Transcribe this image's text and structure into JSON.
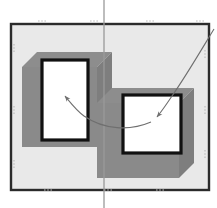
{
  "figure": {
    "width": 217,
    "height": 208,
    "background": "#ffffff"
  },
  "colors": {
    "page_background": "#ffffff",
    "canvas_fill": "#e9e9e9",
    "canvas_stroke": "#2b2b2b",
    "box_fill_top": "#8d8d8d",
    "box_fill_side": "#7e7e7e",
    "box_fill_front": "#8a8a8a",
    "window_fill": "#ffffff",
    "window_stroke": "#111111",
    "axis_line": "#9a9a9a",
    "arrow_stroke": "#6f6f6f",
    "tick_mark": "#bdbdbd"
  },
  "canvas_frame": {
    "name": "outer-frame",
    "x": 11,
    "y": 24,
    "width": 198,
    "height": 166,
    "stroke_width": 2.4
  },
  "vertical_axis": {
    "name": "vertical-axis-line",
    "x": 104,
    "y1": 0,
    "y2": 208,
    "stroke_width": 1.3
  },
  "boxes": [
    {
      "id": "left-box",
      "label": "left-extruded-box",
      "front": [
        [
          22,
          67
        ],
        [
          22,
          147
        ],
        [
          37,
          158
        ],
        [
          97,
          158
        ],
        [
          97,
          77
        ],
        [
          82,
          67
        ]
      ],
      "top": [
        [
          22,
          67
        ],
        [
          37,
          52
        ],
        [
          97,
          52
        ],
        [
          82,
          67
        ]
      ],
      "side": [
        [
          22,
          67
        ],
        [
          22,
          147
        ],
        [
          37,
          158
        ],
        [
          37,
          80
        ],
        [
          37,
          80
        ],
        [
          37,
          52
        ]
      ],
      "outline_top": [
        [
          22,
          67
        ],
        [
          37,
          52
        ],
        [
          97,
          52
        ],
        [
          112,
          67
        ],
        [
          112,
          143
        ],
        [
          97,
          158
        ],
        [
          37,
          158
        ],
        [
          22,
          147
        ]
      ]
    },
    {
      "id": "right-box",
      "label": "right-extruded-box",
      "outline_top": [
        [
          104,
          103
        ],
        [
          119,
          88
        ],
        [
          179,
          88
        ],
        [
          194,
          103
        ],
        [
          194,
          178
        ],
        [
          179,
          193
        ],
        [
          119,
          193
        ],
        [
          104,
          182
        ]
      ]
    }
  ],
  "windows": [
    {
      "id": "left-window",
      "label": "left-window-rect",
      "x": 42,
      "y": 60,
      "width": 46,
      "height": 80,
      "stroke_width": 3.2
    },
    {
      "id": "right-window",
      "label": "right-window-rect",
      "x": 123,
      "y": 95,
      "width": 58,
      "height": 58,
      "stroke_width": 3.2
    }
  ],
  "arrows": [
    {
      "id": "arrow-right-to-left",
      "label": "mapping-arrow-left",
      "path": "M 151,122 C 130,131 104,130 84,116 C 76,110 70,102 65,96",
      "head_at": [
        63,
        94
      ],
      "head_angle_deg": 228,
      "stroke_width": 1.1
    },
    {
      "id": "arrow-outside-to-right",
      "label": "mapping-arrow-right",
      "path": "M 214,29 C 200,52 186,76 172,96 C 166,105 161,112 157,117",
      "head_at": [
        154,
        120
      ],
      "head_angle_deg": 128,
      "stroke_width": 1.1
    }
  ],
  "tick_marks": {
    "label": "dashed-guide-ticks",
    "top": [
      {
        "x": 38,
        "y": 21,
        "len": 9
      },
      {
        "x": 90,
        "y": 21,
        "len": 9
      },
      {
        "x": 146,
        "y": 21,
        "len": 9
      },
      {
        "x": 196,
        "y": 21,
        "len": 9
      }
    ],
    "bottom": [
      {
        "x": 44,
        "y": 190,
        "len": 9
      },
      {
        "x": 104,
        "y": 190,
        "len": 9
      },
      {
        "x": 156,
        "y": 190,
        "len": 9
      }
    ],
    "left": [
      {
        "x": 14,
        "y": 44,
        "len": 9
      },
      {
        "x": 14,
        "y": 106,
        "len": 9
      },
      {
        "x": 14,
        "y": 160,
        "len": 9
      }
    ],
    "right": [
      {
        "x": 205,
        "y": 50,
        "len": 9
      },
      {
        "x": 205,
        "y": 106,
        "len": 9
      },
      {
        "x": 205,
        "y": 150,
        "len": 9
      }
    ]
  },
  "chart_data": {
    "type": "diagram",
    "title": "",
    "elements": [
      "outer-frame",
      "vertical-axis-line",
      "left-extruded-box",
      "right-extruded-box",
      "left-window-rect",
      "right-window-rect",
      "mapping-arrow-left",
      "mapping-arrow-right",
      "dashed-guide-ticks"
    ]
  }
}
